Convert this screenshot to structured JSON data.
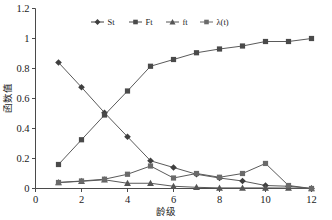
{
  "chart_data": {
    "type": "line",
    "title": "",
    "xlabel": "龄级",
    "ylabel": "函数值",
    "xlim": [
      0,
      12
    ],
    "ylim": [
      0,
      1.2
    ],
    "xticks": [
      "0",
      "2",
      "4",
      "6",
      "8",
      "10",
      "12"
    ],
    "xtick_values": [
      0,
      2,
      4,
      6,
      8,
      10,
      12
    ],
    "yticks": [
      "0",
      "0.2",
      "0.4",
      "0.6",
      "0.8",
      "1",
      "1.2"
    ],
    "ytick_values": [
      0,
      0.2,
      0.4,
      0.6,
      0.8,
      1,
      1.2
    ],
    "grid": false,
    "legend_position": "top-center",
    "x": [
      1,
      2,
      3,
      4,
      5,
      6,
      7,
      8,
      9,
      10,
      11,
      12
    ],
    "series": [
      {
        "name": "St",
        "marker": "diamond",
        "color": "#3f3f3f",
        "values": [
          0.84,
          0.675,
          0.505,
          0.345,
          0.185,
          0.14,
          0.095,
          0.07,
          0.05,
          0.02,
          0.015,
          0.0
        ]
      },
      {
        "name": "Ft",
        "marker": "square",
        "color": "#4a4a4a",
        "values": [
          0.16,
          0.325,
          0.49,
          0.65,
          0.815,
          0.86,
          0.905,
          0.93,
          0.95,
          0.98,
          0.98,
          1.0
        ]
      },
      {
        "name": "ft",
        "marker": "triangle",
        "color": "#555555",
        "values": [
          0.04,
          0.048,
          0.058,
          0.035,
          0.035,
          0.015,
          0.008,
          0.004,
          0.004,
          0.004,
          0.003,
          0.0
        ]
      },
      {
        "name": "λ(t)",
        "marker": "square",
        "color": "#6a6a6a",
        "values": [
          0.04,
          0.05,
          0.062,
          0.095,
          0.15,
          0.07,
          0.1,
          0.075,
          0.1,
          0.167,
          0.02,
          0.0
        ]
      }
    ]
  },
  "legend": {
    "entries": [
      {
        "label": "St"
      },
      {
        "label": "Ft"
      },
      {
        "label": "ft"
      },
      {
        "label": "λ(t)"
      }
    ]
  },
  "axes": {
    "x_title": "龄级",
    "y_title": "函数值"
  },
  "colors": {
    "axis": "#4a4a4a",
    "line": "#5a5a5a",
    "text": "#1a1a1a",
    "background": "#ffffff"
  }
}
